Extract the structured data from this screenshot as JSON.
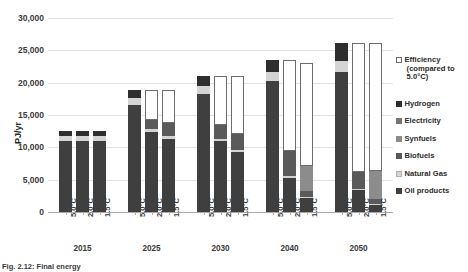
{
  "chart_data": {
    "type": "bar",
    "subtype": "stacked-grouped-column",
    "title": "",
    "xlabel": "",
    "ylabel": "PJ/yr",
    "ylim": [
      0,
      30000
    ],
    "ytick_values": [
      0,
      5000,
      10000,
      15000,
      20000,
      25000,
      30000
    ],
    "ytick_labels": [
      "0",
      "5,000",
      "10,000",
      "15,000",
      "20,000",
      "25,000",
      "30,000"
    ],
    "grid": true,
    "legend_position": "right",
    "groups": [
      "2015",
      "2025",
      "2030",
      "2040",
      "2050"
    ],
    "scenarios": [
      "5.0°C",
      "2.0°C",
      "1.5°C"
    ],
    "series": [
      {
        "name": "Oil products",
        "color": "#3f3f3f"
      },
      {
        "name": "Natural Gas",
        "color": "#d4d4d4"
      },
      {
        "name": "Biofuels",
        "color": "#5a5a5a"
      },
      {
        "name": "Synfuels",
        "color": "#8c8c8c"
      },
      {
        "name": "Electricity",
        "color": "#767676"
      },
      {
        "name": "Hydrogen",
        "color": "#2e2e2e"
      },
      {
        "name": "Efficiency (compared to 5.0°C)",
        "color": "#ffffff"
      }
    ],
    "bars": [
      {
        "group": "2015",
        "scenario": "5.0°C",
        "total": 12600,
        "values": {
          "Oil products": 11000,
          "Natural Gas": 700,
          "Biofuels": 0,
          "Synfuels": 0,
          "Electricity": 0,
          "Hydrogen": 900,
          "Efficiency": 0
        }
      },
      {
        "group": "2015",
        "scenario": "2.0°C",
        "total": 12600,
        "values": {
          "Oil products": 11000,
          "Natural Gas": 700,
          "Biofuels": 0,
          "Synfuels": 0,
          "Electricity": 0,
          "Hydrogen": 900,
          "Efficiency": 0
        }
      },
      {
        "group": "2015",
        "scenario": "1.5°C",
        "total": 12600,
        "values": {
          "Oil products": 11000,
          "Natural Gas": 700,
          "Biofuels": 0,
          "Synfuels": 0,
          "Electricity": 0,
          "Hydrogen": 900,
          "Efficiency": 0
        }
      },
      {
        "group": "2025",
        "scenario": "5.0°C",
        "total": 18800,
        "values": {
          "Oil products": 16500,
          "Natural Gas": 1100,
          "Biofuels": 0,
          "Synfuels": 0,
          "Electricity": 0,
          "Hydrogen": 1200,
          "Efficiency": 0
        }
      },
      {
        "group": "2025",
        "scenario": "2.0°C",
        "total": 18800,
        "values": {
          "Oil products": 12300,
          "Natural Gas": 500,
          "Biofuels": 1500,
          "Synfuels": 0,
          "Electricity": 0,
          "Hydrogen": 0,
          "Efficiency": 4500
        }
      },
      {
        "group": "2025",
        "scenario": "1.5°C",
        "total": 18800,
        "values": {
          "Oil products": 11300,
          "Natural Gas": 400,
          "Biofuels": 2000,
          "Synfuels": 0,
          "Electricity": 0,
          "Hydrogen": 0,
          "Efficiency": 5100
        }
      },
      {
        "group": "2030",
        "scenario": "5.0°C",
        "total": 21000,
        "values": {
          "Oil products": 18300,
          "Natural Gas": 1200,
          "Biofuels": 0,
          "Synfuels": 0,
          "Electricity": 0,
          "Hydrogen": 1500,
          "Efficiency": 0
        }
      },
      {
        "group": "2030",
        "scenario": "2.0°C",
        "total": 21000,
        "values": {
          "Oil products": 11000,
          "Natural Gas": 300,
          "Biofuels": 2200,
          "Synfuels": 0,
          "Electricity": 0,
          "Hydrogen": 0,
          "Efficiency": 7500
        }
      },
      {
        "group": "2030",
        "scenario": "1.5°C",
        "total": 21000,
        "values": {
          "Oil products": 9300,
          "Natural Gas": 300,
          "Biofuels": 2400,
          "Synfuels": 0,
          "Electricity": 0,
          "Hydrogen": 0,
          "Efficiency": 9000
        }
      },
      {
        "group": "2040",
        "scenario": "5.0°C",
        "total": 23500,
        "values": {
          "Oil products": 20300,
          "Natural Gas": 1300,
          "Biofuels": 0,
          "Synfuels": 0,
          "Electricity": 0,
          "Hydrogen": 1900,
          "Efficiency": 0
        }
      },
      {
        "group": "2040",
        "scenario": "2.0°C",
        "total": 23500,
        "values": {
          "Oil products": 5200,
          "Natural Gas": 400,
          "Biofuels": 3900,
          "Synfuels": 0,
          "Electricity": 0,
          "Hydrogen": 0,
          "Efficiency": 14000
        }
      },
      {
        "group": "2040",
        "scenario": "1.5°C",
        "total": 23500,
        "values": {
          "Oil products": 2100,
          "Natural Gas": 200,
          "Biofuels": 1000,
          "Synfuels": 3800,
          "Electricity": 0,
          "Hydrogen": 0,
          "Efficiency": 15900
        }
      },
      {
        "group": "2050",
        "scenario": "5.0°C",
        "total": 26200,
        "values": {
          "Oil products": 21700,
          "Natural Gas": 1700,
          "Biofuels": 0,
          "Synfuels": 0,
          "Electricity": 0,
          "Hydrogen": 2800,
          "Efficiency": 0
        }
      },
      {
        "group": "2050",
        "scenario": "2.0°C",
        "total": 26200,
        "values": {
          "Oil products": 3400,
          "Natural Gas": 200,
          "Biofuels": 2600,
          "Synfuels": 0,
          "Electricity": 0,
          "Hydrogen": 0,
          "Efficiency": 20000
        }
      },
      {
        "group": "2050",
        "scenario": "1.5°C",
        "total": 26200,
        "values": {
          "Oil products": 1100,
          "Natural Gas": 100,
          "Biofuels": 800,
          "Synfuels": 4300,
          "Electricity": 0,
          "Hydrogen": 0,
          "Efficiency": 19900
        }
      }
    ]
  },
  "legend": {
    "items": [
      {
        "label": "Efficiency",
        "label2": "(compared to",
        "label3": "5.0°C)",
        "swatch": "#ffffff",
        "border": "#6d6d6d"
      },
      {
        "label": "Hydrogen",
        "swatch": "#2e2e2e",
        "border": "#2e2e2e"
      },
      {
        "label": "Electricity",
        "swatch": "#767676",
        "border": "#767676"
      },
      {
        "label": "Synfuels",
        "swatch": "#8c8c8c",
        "border": "#8c8c8c"
      },
      {
        "label": "Biofuels",
        "swatch": "#5a5a5a",
        "border": "#5a5a5a"
      },
      {
        "label": "Natural Gas",
        "swatch": "#d4d4d4",
        "border": "#b0b0b0"
      },
      {
        "label": "Oil products",
        "swatch": "#3f3f3f",
        "border": "#3f3f3f"
      }
    ]
  },
  "caption": {
    "text": "Fig. 2.12: Final energy"
  }
}
